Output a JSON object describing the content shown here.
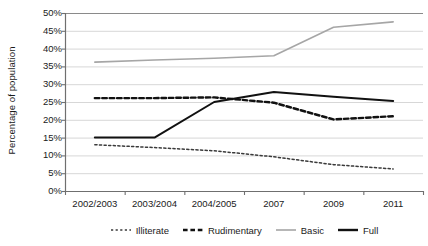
{
  "chart_data": {
    "type": "line",
    "title": "",
    "xlabel": "",
    "ylabel": "Percentage of population",
    "categories": [
      "2002/2003",
      "2003/2004",
      "2004/2005",
      "2007",
      "2009",
      "2011"
    ],
    "ylim": [
      0,
      50
    ],
    "ytick_labels": [
      "0%",
      "5%",
      "10%",
      "15%",
      "20%",
      "25%",
      "30%",
      "35%",
      "40%",
      "45%",
      "50%"
    ],
    "ytick_values": [
      0,
      5,
      10,
      15,
      20,
      25,
      30,
      35,
      40,
      45,
      50
    ],
    "grid": "horizontal",
    "legend_position": "bottom",
    "series": [
      {
        "name": "Illiterate",
        "style": "dotted",
        "color": "#3a3a3a",
        "values": [
          13.0,
          12.2,
          11.3,
          9.6,
          7.4,
          6.2
        ]
      },
      {
        "name": "Rudimentary",
        "style": "dashed",
        "color": "#111111",
        "values": [
          26.1,
          26.1,
          26.3,
          24.8,
          20.1,
          21.0
        ]
      },
      {
        "name": "Basic",
        "style": "solid",
        "color": "#a6a6a6",
        "values": [
          36.2,
          36.8,
          37.3,
          38.0,
          46.0,
          47.5
        ]
      },
      {
        "name": "Full",
        "style": "solid",
        "color": "#111111",
        "values": [
          15.0,
          15.0,
          25.0,
          27.8,
          26.5,
          25.3
        ]
      }
    ]
  },
  "axis": {
    "y_title": "Percentage of population"
  },
  "legend": {
    "items": [
      {
        "label": "Illiterate",
        "icon": "dotted-line-swatch"
      },
      {
        "label": "Rudimentary",
        "icon": "dashed-line-swatch"
      },
      {
        "label": "Basic",
        "icon": "gray-solid-line-swatch"
      },
      {
        "label": "Full",
        "icon": "black-solid-line-swatch"
      }
    ]
  }
}
